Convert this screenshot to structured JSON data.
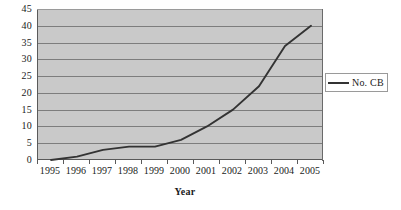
{
  "chart_data": {
    "type": "line",
    "title": "",
    "xlabel": "Year",
    "ylabel": "",
    "categories": [
      "1995",
      "1996",
      "1997",
      "1998",
      "1999",
      "2000",
      "2001",
      "2002",
      "2003",
      "2004",
      "2005"
    ],
    "series": [
      {
        "name": "No. CB",
        "values": [
          0,
          1,
          3,
          4,
          4,
          6,
          10,
          15,
          22,
          34,
          40
        ],
        "color": "#333333"
      }
    ],
    "ylim": [
      0,
      45
    ],
    "ytick_step": 5,
    "ytick_labels": [
      "45",
      "40",
      "35",
      "30",
      "25",
      "20",
      "15",
      "10",
      "5",
      "0"
    ],
    "grid": true,
    "grid_orientation": "horizontal",
    "legend_position": "right",
    "legend_entries": [
      "No. CB"
    ],
    "plot_background": "#c9c9c9",
    "gridline_color": "#7d7d7d",
    "axis_color": "#5a5a5a",
    "page_background": "#ffffff"
  }
}
